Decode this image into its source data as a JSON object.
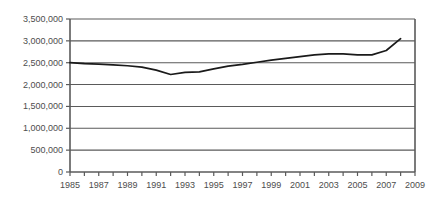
{
  "chart_data": {
    "type": "line",
    "title": "",
    "xlabel": "",
    "ylabel": "",
    "grid": true,
    "legend": false,
    "xlim": [
      1985,
      2009
    ],
    "ylim": [
      0,
      3500000
    ],
    "y_ticks": [
      0,
      500000,
      1000000,
      1500000,
      2000000,
      2500000,
      3000000,
      3500000
    ],
    "y_tick_labels": [
      "0",
      "500,000",
      "1,000,000",
      "1,500,000",
      "2,000,000",
      "2,500,000",
      "3,000,000",
      "3,500,000"
    ],
    "x_ticks": [
      1985,
      1986,
      1987,
      1988,
      1989,
      1990,
      1991,
      1992,
      1993,
      1994,
      1995,
      1996,
      1997,
      1998,
      1999,
      2000,
      2001,
      2002,
      2003,
      2004,
      2005,
      2006,
      2007,
      2008,
      2009
    ],
    "x_tick_labels": [
      "1985",
      "1987",
      "1989",
      "1991",
      "1993",
      "1995",
      "1997",
      "1999",
      "2001",
      "2003",
      "2005",
      "2007",
      "2009"
    ],
    "x_labeled_ticks": [
      1985,
      1987,
      1989,
      1991,
      1993,
      1995,
      1997,
      1999,
      2001,
      2003,
      2005,
      2007,
      2009
    ],
    "x": [
      1985,
      1986,
      1987,
      1988,
      1989,
      1990,
      1991,
      1992,
      1993,
      1994,
      1995,
      1996,
      1997,
      1998,
      1999,
      2000,
      2001,
      2002,
      2003,
      2004,
      2005,
      2006,
      2007,
      2008
    ],
    "values": [
      2500000,
      2480000,
      2470000,
      2450000,
      2430000,
      2400000,
      2330000,
      2230000,
      2280000,
      2290000,
      2360000,
      2420000,
      2460000,
      2510000,
      2560000,
      2600000,
      2640000,
      2680000,
      2700000,
      2700000,
      2680000,
      2680000,
      2780000,
      3050000
    ],
    "series_name": "",
    "line_color": "#1a1a1a",
    "grid_color": "#5a5a5a",
    "axis_color": "#5a5a5a",
    "text_color": "#4d4d4d"
  },
  "axes": {
    "plot_left_px": 70,
    "plot_right_px": 415,
    "plot_top_px": 19,
    "plot_bottom_px": 172
  }
}
